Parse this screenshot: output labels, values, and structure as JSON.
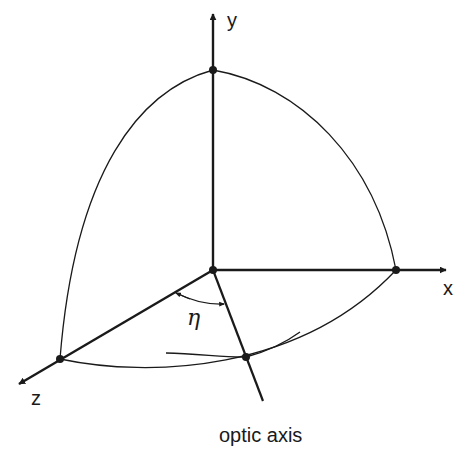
{
  "diagram": {
    "type": "3d-coordinate-octant",
    "axes": {
      "y": {
        "label": "y"
      },
      "x": {
        "label": "x"
      },
      "z": {
        "label": "z"
      }
    },
    "optic_axis": {
      "label": "optic axis"
    },
    "angle": {
      "symbol": "η",
      "name": "eta"
    },
    "points": [
      "origin",
      "y-intercept",
      "x-intercept",
      "z-intercept",
      "optic-axis-intercept"
    ],
    "colors": {
      "ink": "#1a1a1a",
      "background": "#ffffff"
    }
  }
}
